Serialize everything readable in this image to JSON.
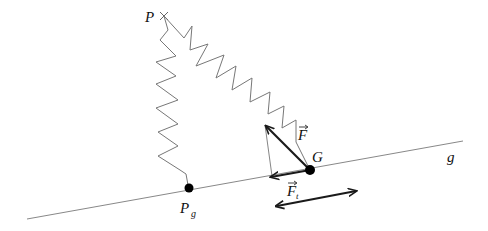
{
  "diagram": {
    "labels": {
      "P": "P",
      "P_g": "P",
      "P_g_sub": "g",
      "G": "G",
      "g": "g",
      "F": "F",
      "F_t": "F",
      "F_t_sub": "t",
      "vec_arrow": "⃗"
    },
    "colors": {
      "line": "#888888",
      "spring": "#777777",
      "vector": "#1a1a1a",
      "point": "#000000"
    },
    "elements": [
      "line g (inclined)",
      "point P (fixed, marked x)",
      "point P_g on line g",
      "point G on line g",
      "spring from P to P_g",
      "spring from P to G",
      "force vector F at G",
      "tangential force vector F_t at G along g",
      "double-headed arrow indicating motion along g"
    ]
  }
}
